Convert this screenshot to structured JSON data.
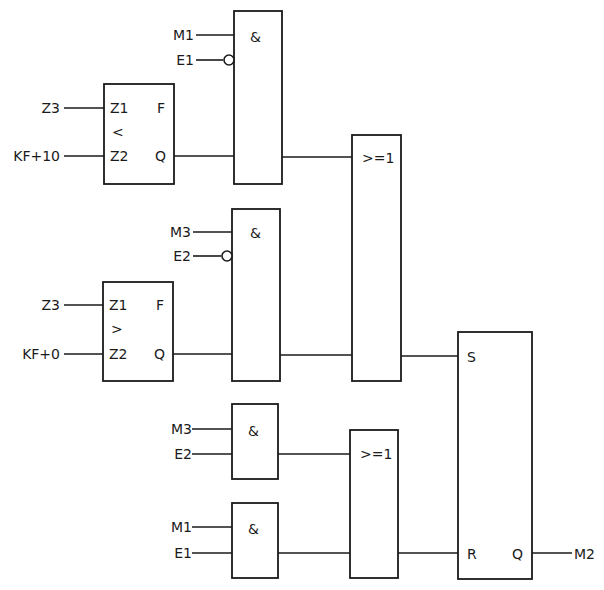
{
  "diagram": {
    "type": "logic function block diagram (FBD)",
    "blocks": {
      "cmp1": {
        "in1_pin": "Z1",
        "in2_pin": "Z2",
        "op": "<",
        "out_f": "F",
        "out_q": "Q",
        "in1_signal": "Z3",
        "in2_signal": "KF+10"
      },
      "and1": {
        "label": "&",
        "in1_signal": "M1",
        "in2_signal": "E1",
        "in2_negated": true
      },
      "cmp2": {
        "in1_pin": "Z1",
        "in2_pin": "Z2",
        "op": ">",
        "out_f": "F",
        "out_q": "Q",
        "in1_signal": "Z3",
        "in2_signal": "KF+0"
      },
      "and2": {
        "label": "&",
        "in1_signal": "M3",
        "in2_signal": "E2",
        "in2_negated": true
      },
      "or1": {
        "label": ">=1"
      },
      "and3": {
        "label": "&",
        "in1_signal": "M3",
        "in2_signal": "E2"
      },
      "and4": {
        "label": "&",
        "in1_signal": "M1",
        "in2_signal": "E1"
      },
      "or2": {
        "label": ">=1"
      },
      "sr": {
        "set_pin": "S",
        "reset_pin": "R",
        "out_pin": "Q",
        "out_signal": "M2"
      }
    }
  }
}
